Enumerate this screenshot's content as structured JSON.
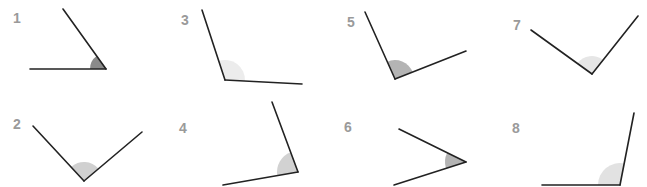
{
  "angles": [
    {
      "label": "1",
      "label_pos": [
        17,
        18
      ],
      "vertex": [
        106,
        69
      ],
      "arm_a": [
        30,
        69
      ],
      "arm_b": [
        63,
        9
      ],
      "wedge_color": "#8a8a8a",
      "wedge_radius": 16
    },
    {
      "label": "3",
      "label_pos": [
        185,
        20
      ],
      "vertex": [
        225,
        80
      ],
      "arm_a": [
        202,
        10
      ],
      "arm_b": [
        302,
        84
      ],
      "wedge_color": "#ececec",
      "wedge_radius": 20
    },
    {
      "label": "5",
      "label_pos": [
        351,
        22
      ],
      "vertex": [
        395,
        79
      ],
      "arm_a": [
        365,
        12
      ],
      "arm_b": [
        466,
        51
      ],
      "wedge_color": "#b4b4b4",
      "wedge_radius": 19
    },
    {
      "label": "7",
      "label_pos": [
        517,
        25
      ],
      "vertex": [
        592,
        74
      ],
      "arm_a": [
        531,
        30
      ],
      "arm_b": [
        638,
        16
      ],
      "wedge_color": "#e6e6e6",
      "wedge_radius": 18
    },
    {
      "label": "2",
      "label_pos": [
        17,
        124
      ],
      "vertex": [
        84,
        181
      ],
      "arm_a": [
        33,
        126
      ],
      "arm_b": [
        142,
        132
      ],
      "wedge_color": "#d0d0d0",
      "wedge_radius": 19
    },
    {
      "label": "4",
      "label_pos": [
        183,
        128
      ],
      "vertex": [
        298,
        172
      ],
      "arm_a": [
        272,
        102
      ],
      "arm_b": [
        223,
        185
      ],
      "wedge_color": "#d2d2d2",
      "wedge_radius": 21
    },
    {
      "label": "6",
      "label_pos": [
        348,
        127
      ],
      "vertex": [
        466,
        162
      ],
      "arm_a": [
        399,
        129
      ],
      "arm_b": [
        394,
        185
      ],
      "wedge_color": "#b4b4b4",
      "wedge_radius": 21
    },
    {
      "label": "8",
      "label_pos": [
        516,
        128
      ],
      "vertex": [
        620,
        185
      ],
      "arm_a": [
        634,
        113
      ],
      "arm_b": [
        542,
        185
      ],
      "wedge_color": "#e2e2e2",
      "wedge_radius": 22
    }
  ]
}
